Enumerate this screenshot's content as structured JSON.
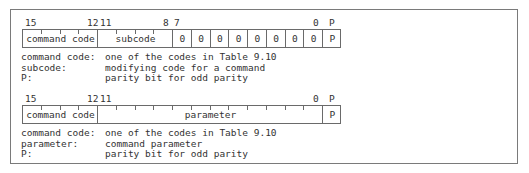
{
  "formats": [
    {
      "bit_labels": [
        {
          "text": "15",
          "x": 25
        },
        {
          "text": "12",
          "x": 87
        },
        {
          "text": "11",
          "x": 100
        },
        {
          "text": "8",
          "x": 163
        },
        {
          "text": "7",
          "x": 174
        },
        {
          "text": "0",
          "x": 313
        },
        {
          "text": "P",
          "x": 329
        }
      ],
      "fields": [
        {
          "name": "command code",
          "start": 0,
          "width": 4
        },
        {
          "name": "subcode",
          "start": 4,
          "width": 4
        },
        {
          "name": "0",
          "start": 8,
          "width": 1
        },
        {
          "name": "0",
          "start": 9,
          "width": 1
        },
        {
          "name": "0",
          "start": 10,
          "width": 1
        },
        {
          "name": "0",
          "start": 11,
          "width": 1
        },
        {
          "name": "0",
          "start": 12,
          "width": 1
        },
        {
          "name": "0",
          "start": 13,
          "width": 1
        },
        {
          "name": "0",
          "start": 14,
          "width": 1
        },
        {
          "name": "0",
          "start": 15,
          "width": 1
        },
        {
          "name": "P",
          "start": 16,
          "width": 1
        }
      ],
      "legend": [
        {
          "key": "command code:",
          "value": "one of the codes in Table 9.10"
        },
        {
          "key": "subcode:",
          "value": "modifying code for a command"
        },
        {
          "key": "P:",
          "value": "parity bit for odd parity"
        }
      ]
    },
    {
      "bit_labels": [
        {
          "text": "15",
          "x": 25
        },
        {
          "text": "12",
          "x": 87
        },
        {
          "text": "11",
          "x": 100
        },
        {
          "text": "0",
          "x": 313
        },
        {
          "text": "P",
          "x": 329
        }
      ],
      "fields": [
        {
          "name": "command code",
          "start": 0,
          "width": 4
        },
        {
          "name": "parameter",
          "start": 4,
          "width": 12
        },
        {
          "name": "P",
          "start": 16,
          "width": 1
        }
      ],
      "legend": [
        {
          "key": "command code:",
          "value": "one of the codes in Table 9.10"
        },
        {
          "key": "parameter:",
          "value": "command parameter"
        },
        {
          "key": "P:",
          "value": "parity bit for odd parity"
        }
      ]
    }
  ]
}
